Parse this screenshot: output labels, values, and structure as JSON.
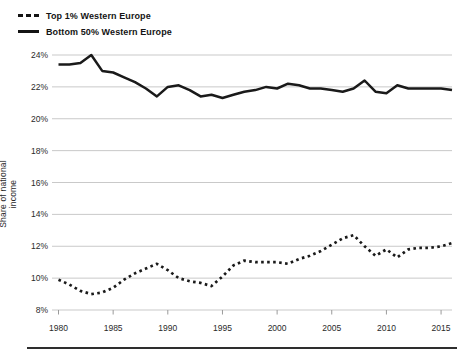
{
  "chart_data": {
    "type": "line",
    "title": "",
    "xlabel": "",
    "ylabel": "Share of national income",
    "grid": true,
    "legend_position": "top-left",
    "line_color": "#1a1a1a",
    "grid_color": "#c9c9c9",
    "tick_color": "#9a9a9a",
    "text_color": "#2a2a2a",
    "separator_color": "#2e2e2e",
    "ylim": [
      8,
      24
    ],
    "xlim": [
      1980,
      2016
    ],
    "yticks": [
      24,
      22,
      20,
      18,
      16,
      14,
      12,
      10,
      8
    ],
    "ytick_labels": [
      "24%",
      "22%",
      "20%",
      "18%",
      "16%",
      "14%",
      "12%",
      "10%",
      "8%"
    ],
    "xticks": [
      1980,
      1985,
      1990,
      1995,
      2000,
      2005,
      2010,
      2015
    ],
    "xtick_labels": [
      "1980",
      "1985",
      "1990",
      "1995",
      "2000",
      "2005",
      "2010",
      "2015"
    ],
    "x": [
      1980,
      1981,
      1982,
      1983,
      1984,
      1985,
      1986,
      1987,
      1988,
      1989,
      1990,
      1991,
      1992,
      1993,
      1994,
      1995,
      1996,
      1997,
      1998,
      1999,
      2000,
      2001,
      2002,
      2003,
      2004,
      2005,
      2006,
      2007,
      2008,
      2009,
      2010,
      2011,
      2012,
      2013,
      2014,
      2015,
      2016
    ],
    "series": [
      {
        "name": "Top 1% Western Europe",
        "style": "dashed",
        "values": [
          9.9,
          9.6,
          9.2,
          9.0,
          9.1,
          9.4,
          9.9,
          10.3,
          10.6,
          10.9,
          10.5,
          10.0,
          9.8,
          9.7,
          9.5,
          10.1,
          10.8,
          11.1,
          11.0,
          11.0,
          11.0,
          10.9,
          11.2,
          11.4,
          11.7,
          12.1,
          12.5,
          12.7,
          12.0,
          11.4,
          11.8,
          11.3,
          11.8,
          11.9,
          11.9,
          12.0,
          12.2
        ]
      },
      {
        "name": "Bottom 50% Western Europe",
        "style": "solid",
        "values": [
          23.4,
          23.4,
          23.5,
          24.0,
          23.0,
          22.9,
          22.6,
          22.3,
          21.9,
          21.4,
          22.0,
          22.1,
          21.8,
          21.4,
          21.5,
          21.3,
          21.5,
          21.7,
          21.8,
          22.0,
          21.9,
          22.2,
          22.1,
          21.9,
          21.9,
          21.8,
          21.7,
          21.9,
          22.4,
          21.7,
          21.6,
          22.1,
          21.9,
          21.9,
          21.9,
          21.9,
          21.8
        ]
      }
    ]
  }
}
